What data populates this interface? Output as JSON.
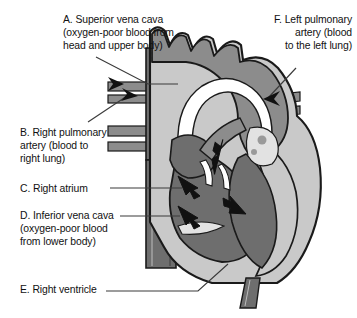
{
  "figure": {
    "type": "labeled-anatomical-diagram",
    "width": 357,
    "height": 318,
    "background": "#ffffff"
  },
  "labels": {
    "a": {
      "key": "A",
      "text": "A. Superior vena cava\n(oxygen-poor blood from\nhead and upper body)",
      "align": "left"
    },
    "b": {
      "key": "B",
      "text": "B. Right pulmonary\nartery (blood to\nright lung)",
      "align": "left"
    },
    "c": {
      "key": "C",
      "text": "C. Right atrium",
      "align": "left"
    },
    "d": {
      "key": "D",
      "text": "D. Inferior vena cava\n(oxygen-poor blood\nfrom lower body)",
      "align": "left"
    },
    "e": {
      "key": "E",
      "text": "E. Right ventricle",
      "align": "left"
    },
    "f": {
      "key": "F",
      "text": "F. Left pulmonary\nartery (blood\nto the left lung)",
      "align": "right"
    }
  },
  "colors": {
    "outline": "#1a1a1a",
    "muscle_mid_gray": "#8c8c8c",
    "chamber_dark_gray": "#6e6e6e",
    "wall_light_gray": "#c9c9c9",
    "highlight_pale": "#e2e2e2",
    "white": "#ffffff",
    "leader_line": "#3a3a3a",
    "arrow_fill": "#111111"
  },
  "anatomy_parts": [
    "superior-vena-cava",
    "inferior-vena-cava",
    "right-pulmonary-artery",
    "left-pulmonary-artery",
    "aortic-arch",
    "right-atrium",
    "right-ventricle",
    "left-ventricle",
    "descending-aorta"
  ]
}
